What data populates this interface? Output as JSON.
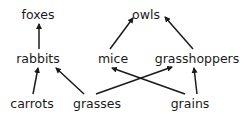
{
  "diagram": {
    "type": "food-web",
    "colors": {
      "text": "#1a1a1a",
      "edge": "#1a1a1a",
      "background": "#ffffff"
    },
    "nodes": [
      {
        "id": "foxes",
        "label": "foxes",
        "x": 38,
        "y": 19
      },
      {
        "id": "owls",
        "label": "owls",
        "x": 146,
        "y": 19
      },
      {
        "id": "rabbits",
        "label": "rabbits",
        "x": 38,
        "y": 63
      },
      {
        "id": "mice",
        "label": "mice",
        "x": 113,
        "y": 63
      },
      {
        "id": "grasshoppers",
        "label": "grasshoppers",
        "x": 197,
        "y": 63
      },
      {
        "id": "carrots",
        "label": "carrots",
        "x": 32,
        "y": 108
      },
      {
        "id": "grasses",
        "label": "grasses",
        "x": 97,
        "y": 108
      },
      {
        "id": "grains",
        "label": "grains",
        "x": 190,
        "y": 108
      }
    ],
    "edges": [
      {
        "from": "rabbits",
        "to": "foxes",
        "x1": 39,
        "y1": 49,
        "x2": 39,
        "y2": 24
      },
      {
        "from": "mice",
        "to": "owls",
        "x1": 110,
        "y1": 49,
        "x2": 133,
        "y2": 18
      },
      {
        "from": "grasshoppers",
        "to": "owls",
        "x1": 193,
        "y1": 49,
        "x2": 165,
        "y2": 17
      },
      {
        "from": "carrots",
        "to": "rabbits",
        "x1": 33,
        "y1": 94,
        "x2": 38,
        "y2": 68
      },
      {
        "from": "grasses",
        "to": "rabbits",
        "x1": 84,
        "y1": 94,
        "x2": 56,
        "y2": 68
      },
      {
        "from": "grasses",
        "to": "grasshoppers",
        "x1": 96,
        "y1": 94,
        "x2": 172,
        "y2": 67
      },
      {
        "from": "grains",
        "to": "mice",
        "x1": 185,
        "y1": 94,
        "x2": 112,
        "y2": 68
      },
      {
        "from": "grains",
        "to": "grasshoppers",
        "x1": 197,
        "y1": 94,
        "x2": 194,
        "y2": 68
      }
    ]
  }
}
